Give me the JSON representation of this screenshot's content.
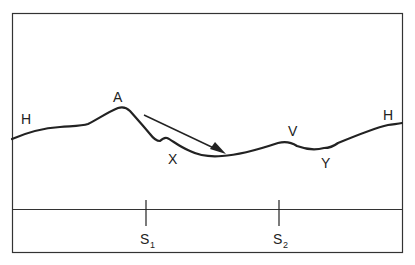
{
  "diagram": {
    "type": "terrain-profile",
    "colors": {
      "line": "#222222",
      "background": "#ffffff"
    },
    "labels": {
      "H_left": "H",
      "A": "A",
      "X": "X",
      "V": "V",
      "Y": "Y",
      "H_right": "H"
    },
    "stations": [
      {
        "base": "S",
        "sub": "1"
      },
      {
        "base": "S",
        "sub": "2"
      }
    ],
    "arrow": {
      "direction": "downslope",
      "from": "A",
      "to": "valley"
    }
  }
}
